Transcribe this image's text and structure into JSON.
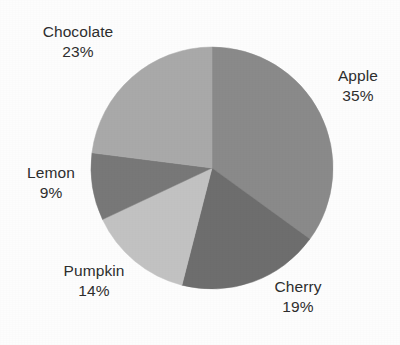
{
  "chart_data": {
    "type": "pie",
    "title": "",
    "subtitle": "",
    "xlabel": "",
    "ylabel": "",
    "grid": false,
    "legend_position": "none",
    "label_format": "name-above-percent",
    "start_angle_deg": 0,
    "direction": "clockwise",
    "categories": [
      "Apple",
      "Cherry",
      "Pumpkin",
      "Lemon",
      "Chocolate"
    ],
    "values": [
      35,
      19,
      14,
      9,
      23
    ],
    "units": "%",
    "total": 100,
    "slices": [
      {
        "label": "Apple",
        "percent_text": "35%",
        "value": 35,
        "color": "#8a8a8a",
        "start_deg": 0,
        "end_deg": 126
      },
      {
        "label": "Cherry",
        "percent_text": "19%",
        "value": 19,
        "color": "#6e6e6e",
        "start_deg": 126,
        "end_deg": 194.4
      },
      {
        "label": "Pumpkin",
        "percent_text": "14%",
        "value": 14,
        "color": "#c2c2c2",
        "start_deg": 194.4,
        "end_deg": 244.8
      },
      {
        "label": "Lemon",
        "percent_text": "9%",
        "value": 9,
        "color": "#787878",
        "start_deg": 244.8,
        "end_deg": 277.2
      },
      {
        "label": "Chocolate",
        "percent_text": "23%",
        "value": 23,
        "color": "#a9a9a9",
        "start_deg": 277.2,
        "end_deg": 360
      }
    ]
  },
  "labels": {
    "apple": {
      "name": "Apple",
      "percent": "35%"
    },
    "cherry": {
      "name": "Cherry",
      "percent": "19%"
    },
    "pumpkin": {
      "name": "Pumpkin",
      "percent": "14%"
    },
    "lemon": {
      "name": "Lemon",
      "percent": "9%"
    },
    "chocolate": {
      "name": "Chocolate",
      "percent": "23%"
    }
  },
  "style": {
    "background": "#fdfdfd",
    "text_color": "#2e2e2e"
  }
}
